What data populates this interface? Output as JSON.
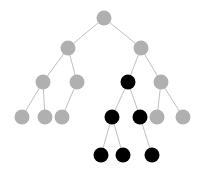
{
  "figure": {
    "width": 205,
    "height": 176,
    "background_color": "#ffffff"
  },
  "legend": {
    "gray_label": "unmarked node",
    "black_label": "marked node"
  },
  "palette": {
    "gray_node": "#b0b0b0",
    "black_node": "#000000",
    "edge": "#b8b8b8",
    "background": "#ffffff"
  },
  "chart_data": {
    "type": "diagram",
    "diagram_type": "tree",
    "title": "",
    "node_radius": 7.5,
    "levels": 5,
    "node_count": 17,
    "gray_count": 11,
    "black_count": 6,
    "nodes": [
      {
        "id": "n0",
        "level": 1,
        "x": 104,
        "y": 18,
        "color": "gray",
        "r": 7.5
      },
      {
        "id": "n1",
        "level": 2,
        "x": 68,
        "y": 48,
        "color": "gray",
        "r": 7.5
      },
      {
        "id": "n2",
        "level": 2,
        "x": 141,
        "y": 48,
        "color": "gray",
        "r": 7.5
      },
      {
        "id": "n3",
        "level": 3,
        "x": 43,
        "y": 82,
        "color": "gray",
        "r": 7.5
      },
      {
        "id": "n4",
        "level": 3,
        "x": 77,
        "y": 82,
        "color": "gray",
        "r": 7.5
      },
      {
        "id": "n5",
        "level": 3,
        "x": 128,
        "y": 82,
        "color": "black",
        "r": 7.5
      },
      {
        "id": "n6",
        "level": 3,
        "x": 161,
        "y": 82,
        "color": "gray",
        "r": 7.5
      },
      {
        "id": "n7",
        "level": 4,
        "x": 22,
        "y": 117,
        "color": "gray",
        "r": 7.5
      },
      {
        "id": "n8",
        "level": 4,
        "x": 45,
        "y": 117,
        "color": "gray",
        "r": 7.5
      },
      {
        "id": "n9",
        "level": 4,
        "x": 62,
        "y": 117,
        "color": "gray",
        "r": 7.5
      },
      {
        "id": "n10",
        "level": 4,
        "x": 112,
        "y": 117,
        "color": "black",
        "r": 7.5
      },
      {
        "id": "n11",
        "level": 4,
        "x": 140,
        "y": 117,
        "color": "black",
        "r": 7.5
      },
      {
        "id": "n12",
        "level": 4,
        "x": 157,
        "y": 117,
        "color": "gray",
        "r": 7.5
      },
      {
        "id": "n13",
        "level": 4,
        "x": 183,
        "y": 117,
        "color": "gray",
        "r": 7.5
      },
      {
        "id": "n14",
        "level": 5,
        "x": 101,
        "y": 155,
        "color": "black",
        "r": 7.5
      },
      {
        "id": "n15",
        "level": 5,
        "x": 123,
        "y": 155,
        "color": "black",
        "r": 7.5
      },
      {
        "id": "n16",
        "level": 5,
        "x": 152,
        "y": 155,
        "color": "black",
        "r": 7.5
      }
    ],
    "edges": [
      {
        "from": "n0",
        "to": "n1"
      },
      {
        "from": "n0",
        "to": "n2"
      },
      {
        "from": "n1",
        "to": "n3"
      },
      {
        "from": "n1",
        "to": "n4"
      },
      {
        "from": "n2",
        "to": "n5"
      },
      {
        "from": "n2",
        "to": "n6"
      },
      {
        "from": "n3",
        "to": "n7"
      },
      {
        "from": "n3",
        "to": "n8"
      },
      {
        "from": "n4",
        "to": "n9"
      },
      {
        "from": "n5",
        "to": "n10"
      },
      {
        "from": "n5",
        "to": "n11"
      },
      {
        "from": "n6",
        "to": "n12"
      },
      {
        "from": "n6",
        "to": "n13"
      },
      {
        "from": "n10",
        "to": "n14"
      },
      {
        "from": "n10",
        "to": "n15"
      },
      {
        "from": "n11",
        "to": "n16"
      }
    ]
  }
}
